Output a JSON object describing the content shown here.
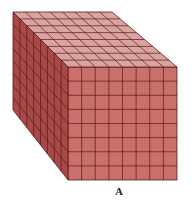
{
  "figure": {
    "grid": {
      "width": 8,
      "height": 8,
      "depth": 8
    },
    "label": "A",
    "colors": {
      "front": "#c9706a",
      "top": "#d9a3a0",
      "side": "#a84848",
      "lines": "#5a1a1a"
    }
  }
}
